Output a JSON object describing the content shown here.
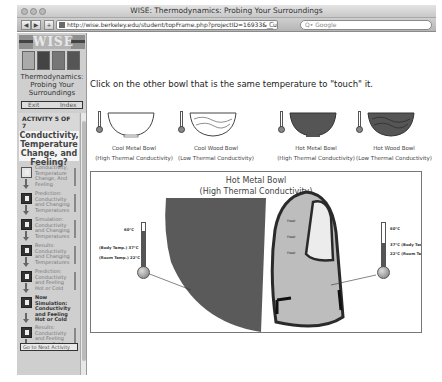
{
  "window": {
    "title": "WISE: Thermodynamics: Probing Your Surroundings",
    "url": "http://wise.berkeley.edu/student/topFrame.php?projectID=16933&__utma=4091440",
    "search_placeholder": "Q• Google",
    "back_label": "◀",
    "forward_label": "▶",
    "add_label": "+",
    "reload_label": "C"
  },
  "sidebar": {
    "logo_text": "WISE",
    "project_title": "Thermodynamics: Probing Your Surroundings",
    "exit_label": "Exit",
    "index_label": "Index",
    "activity_header": "ACTIVITY 5 OF 7",
    "activity_title": "Conductivity, Temperature Change, and Feeling?",
    "steps": [
      {
        "label": "Conductivity, Temperature Change, And Feeling",
        "icon": "note-icon",
        "current": false
      },
      {
        "label": "Prediction: Conductivity and Changing Temperatures",
        "icon": "pencil-icon",
        "current": false
      },
      {
        "label": "Simulation: Conductivity and Changing Temperatures",
        "icon": "flask-icon",
        "current": false
      },
      {
        "label": "Results: Conductivity and Changing Temperatures",
        "icon": "pencil-icon",
        "current": false
      },
      {
        "label": "Prediction: Conductivity and Feeling Hot or Cold",
        "icon": "pencil-icon",
        "current": false
      },
      {
        "label": "Now Simulation: Conductivity and Feeling Hot or Cold",
        "icon": "flask-icon",
        "current": true
      },
      {
        "label": "Results: Conductivity and Feeling Hot or Cold",
        "icon": "pencil-icon",
        "current": false
      }
    ],
    "next_activity_label": "Go to Next Activity"
  },
  "main": {
    "instruction": "Click on the other bowl that is the same temperature to \"touch\" it.",
    "bowls": [
      {
        "name": "Cool Metal Bowl",
        "conductivity": "(High Thermal Conductivity)",
        "fill": "#ffffff",
        "wood": false
      },
      {
        "name": "Cool Wood Bowl",
        "conductivity": "(Low Thermal Conductivity)",
        "fill": "#ffffff",
        "wood": true
      },
      {
        "name": "Hot Metal Bowl",
        "conductivity": "(High Thermal Conductivity)",
        "fill": "#555555",
        "wood": false
      },
      {
        "name": "Hot Wood Bowl",
        "conductivity": "(Low Thermal Conductivity)",
        "fill": "#555555",
        "wood": true
      }
    ],
    "scene": {
      "title": "Hot Metal Bowl",
      "subtitle": "(High Thermal Conductivity)",
      "left_thermometer": {
        "top_label": "60°C",
        "body_label": "(Body Temp.) 37°C",
        "room_label": "(Room Temp.) 22°C"
      },
      "right_thermometer": {
        "top_label": "60°C",
        "body_label": "37°C (Body Temp.)",
        "room_label": "22°C (Room Temp.)"
      }
    }
  },
  "colors": {
    "sidebar_bg": "#cfcfcf",
    "hot_bowl": "#555555",
    "finger": "#bdbdbd",
    "finger_outline": "#2a2a2a"
  }
}
